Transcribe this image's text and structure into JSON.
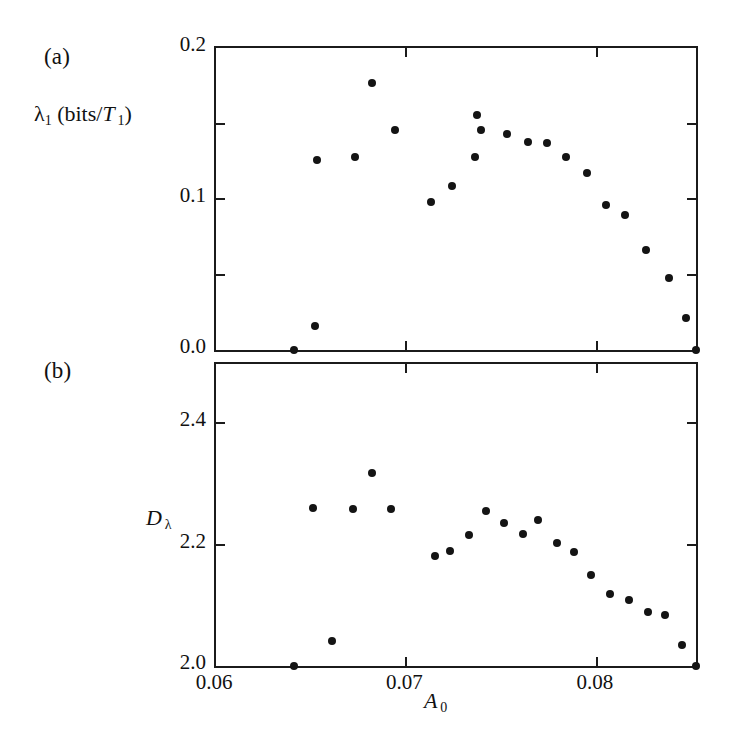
{
  "figure": {
    "panel_a_tag": "(a)",
    "panel_b_tag": "(b)",
    "xlabel_main": "A",
    "xlabel_sub": "0"
  },
  "chart_data": [
    {
      "type": "scatter",
      "panel": "(a)",
      "title": "",
      "xlabel": "A_0",
      "ylabel": "λ_1 (bits/T_1)",
      "ylabel_parts": {
        "lead": "λ",
        "lead_sub": "1",
        "open": " (bits/",
        "ital": "T",
        "ital_sub": "1",
        "close": ")"
      },
      "xlim": [
        0.06,
        0.08521
      ],
      "ylim": [
        0.0,
        0.2
      ],
      "xticks": [
        0.06,
        0.07,
        0.08
      ],
      "xticklabels": [
        "0.06",
        "0.07",
        "0.08"
      ],
      "xminorticks": [],
      "yticks": [
        0.0,
        0.1,
        0.2
      ],
      "yticklabels": [
        "0.0",
        "0.1",
        "0.2"
      ],
      "yminorticks": [
        0.05,
        0.15
      ],
      "grid": false,
      "legend": null,
      "x": [
        0.0641,
        0.0652,
        0.0653,
        0.0673,
        0.0682,
        0.0694,
        0.0713,
        0.0724,
        0.0736,
        0.0737,
        0.0739,
        0.0753,
        0.0764,
        0.0774,
        0.0784,
        0.0795,
        0.0805,
        0.0815,
        0.0826,
        0.0838,
        0.0847,
        0.0852
      ],
      "y": [
        0.0,
        0.0157,
        0.1261,
        0.1275,
        0.1765,
        0.1458,
        0.098,
        0.1085,
        0.1281,
        0.1556,
        0.1458,
        0.1431,
        0.1379,
        0.1373,
        0.1275,
        0.117,
        0.0961,
        0.0895,
        0.066,
        0.048,
        0.0209,
        0.0
      ]
    },
    {
      "type": "scatter",
      "panel": "(b)",
      "title": "",
      "xlabel": "A_0",
      "ylabel": "D_λ",
      "ylabel_parts": {
        "ital": "D",
        "sub": "λ"
      },
      "xlim": [
        0.06,
        0.08521
      ],
      "ylim": [
        2.0,
        2.4976
      ],
      "xticks": [
        0.06,
        0.07,
        0.08
      ],
      "xticklabels": [
        "0.06",
        "0.07",
        "0.08"
      ],
      "yticks": [
        2.0,
        2.2,
        2.4
      ],
      "yticklabels": [
        "2.0",
        "2.2",
        "2.4"
      ],
      "yminorticks": [],
      "grid": false,
      "legend": null,
      "x": [
        0.0641,
        0.0661,
        0.0651,
        0.0672,
        0.0682,
        0.0692,
        0.0715,
        0.0723,
        0.0733,
        0.0742,
        0.0751,
        0.0761,
        0.0769,
        0.0779,
        0.0788,
        0.0797,
        0.0807,
        0.0817,
        0.0827,
        0.0836,
        0.0845,
        0.0852
      ],
      "y": [
        2.0,
        2.0407,
        2.2602,
        2.2585,
        2.3187,
        2.2585,
        2.1805,
        2.1902,
        2.2163,
        2.2553,
        2.2358,
        2.2179,
        2.2407,
        2.2033,
        2.1886,
        2.1496,
        2.1187,
        2.1089,
        2.0894,
        2.0846,
        2.0341,
        2.0
      ]
    }
  ]
}
